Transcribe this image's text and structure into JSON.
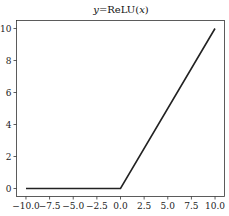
{
  "chart_data": {
    "type": "line",
    "title": "y=ReLU(x)",
    "title_parts": {
      "y": "y",
      "eq": "=ReLU(",
      "x": "x",
      "close": ")"
    },
    "xlabel": "",
    "ylabel": "",
    "xlim": [
      -11.0,
      11.0
    ],
    "ylim": [
      -0.5,
      10.5
    ],
    "x_ticks": [
      -10.0,
      -7.5,
      -5.0,
      -2.5,
      0.0,
      2.5,
      5.0,
      7.5,
      10.0
    ],
    "x_tick_labels": [
      "−10.0",
      "−7.5",
      "−5.0",
      "−2.5",
      "0.0",
      "2.5",
      "5.0",
      "7.5",
      "10.0"
    ],
    "y_ticks": [
      0,
      2,
      4,
      6,
      8,
      10
    ],
    "y_tick_labels": [
      "0",
      "2",
      "4",
      "6",
      "8",
      "10"
    ],
    "grid": false,
    "legend": null,
    "series": [
      {
        "name": "ReLU",
        "color": "#222222",
        "x": [
          -10.0,
          0.0,
          10.0
        ],
        "y": [
          0.0,
          0.0,
          10.0
        ]
      }
    ]
  }
}
